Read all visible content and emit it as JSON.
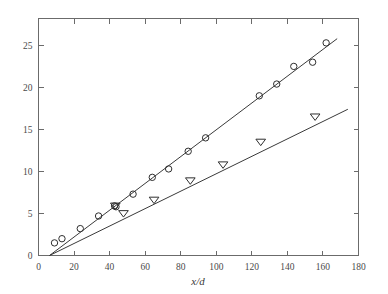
{
  "chart_data": {
    "type": "scatter",
    "title": "",
    "subtitle": "",
    "xlabel": "x/d",
    "ylabel": "",
    "xlim": [
      0,
      180
    ],
    "ylim": [
      0,
      28.2
    ],
    "xticks": [
      0,
      20,
      40,
      60,
      80,
      100,
      120,
      140,
      160,
      180
    ],
    "xtick_labels": [
      "0",
      "20",
      "40",
      "60",
      "80",
      "100",
      "120",
      "140",
      "160",
      "180"
    ],
    "yticks": [
      0,
      5,
      10,
      15,
      20,
      25
    ],
    "ytick_labels": [
      "0",
      "5",
      "10",
      "15",
      "20",
      "25"
    ],
    "y_minor_ticks": [],
    "grid": false,
    "legend": "none",
    "frame": "box-all-sides-mirrored-ticks",
    "series": [
      {
        "name": "circles",
        "marker": "open-circle",
        "marker_size": 4.0,
        "color": "#2e2e2e",
        "points": [
          [
            9.0,
            1.5
          ],
          [
            13.2,
            2.0
          ],
          [
            23.5,
            3.2
          ],
          [
            33.8,
            4.7
          ],
          [
            42.8,
            5.9
          ],
          [
            43.6,
            5.8
          ],
          [
            53.2,
            7.3
          ],
          [
            64.0,
            9.3
          ],
          [
            73.2,
            10.3
          ],
          [
            84.2,
            12.4
          ],
          [
            94.0,
            14.0
          ],
          [
            124.2,
            19.0
          ],
          [
            134.0,
            20.4
          ],
          [
            143.6,
            22.5
          ],
          [
            154.2,
            23.0
          ],
          [
            161.8,
            25.3
          ]
        ],
        "fit": {
          "type": "linear",
          "x_start": 6.2,
          "y_start": 0.0,
          "x_end": 168.0,
          "y_end": 25.8,
          "slope": 0.1595,
          "intercept": -0.989
        }
      },
      {
        "name": "triangles",
        "marker": "open-down-triangle",
        "marker_size": 4.6,
        "color": "#2e2e2e",
        "points": [
          [
            43.2,
            5.9
          ],
          [
            47.8,
            5.0
          ],
          [
            65.0,
            6.6
          ],
          [
            85.4,
            8.9
          ],
          [
            103.8,
            10.8
          ],
          [
            125.0,
            13.5
          ],
          [
            155.6,
            16.5
          ]
        ],
        "fit": {
          "type": "linear",
          "x_start": 6.2,
          "y_start": 0.0,
          "x_end": 174.0,
          "y_end": 17.4,
          "slope": 0.1036,
          "intercept": -0.642
        }
      }
    ]
  },
  "axis_title": {
    "numerator": "x",
    "separator": "/",
    "denominator": "d"
  },
  "colors": {
    "background": "#ffffff",
    "frame": "#6b6b6b",
    "line": "#3a3a3a",
    "marker": "#2e2e2e",
    "text": "#4a4a4a"
  }
}
